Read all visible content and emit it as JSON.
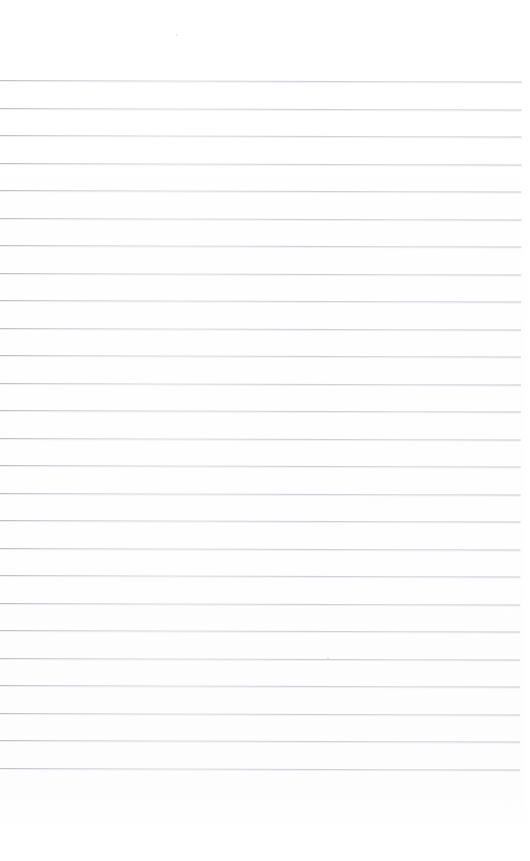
{
  "page": {
    "kind": "scanned-blank-lined-paper",
    "description": "A scanned blank sheet of ruled notebook paper with no writing.",
    "width_px": 530,
    "height_px": 861,
    "background_color": "#ffffff",
    "has_text_content": false,
    "has_margin_rule": false,
    "has_header": false,
    "has_page_number": false
  },
  "ruling": {
    "line_color": "#bfc3c7",
    "line_thickness_px": 1,
    "line_count": 26,
    "line_spacing_px": 27.5,
    "first_line_y_px": 80,
    "last_line_y_px": 773,
    "line_start_x_px": 0,
    "line_end_x_px": 522,
    "skew_degrees": 0.16,
    "top_margin_px": 80,
    "bottom_margin_px": 88,
    "right_margin_px": 8,
    "line_y_positions": [
      80,
      107.5,
      135,
      162.5,
      190,
      217.5,
      245,
      272.5,
      300,
      327.5,
      355,
      382.5,
      410,
      437.5,
      465,
      492.5,
      520,
      547.5,
      575,
      602.5,
      630,
      657.5,
      685,
      712.5,
      740,
      767.5
    ]
  },
  "artifacts": {
    "label": "scan-specks",
    "color": "#cdd0d4",
    "items": [
      {
        "name": "speck-upper",
        "x_px": 176,
        "y_px": 34,
        "size_px": 2.2
      },
      {
        "name": "speck-lower",
        "x_px": 327,
        "y_px": 657,
        "size_px": 1.8
      }
    ]
  }
}
